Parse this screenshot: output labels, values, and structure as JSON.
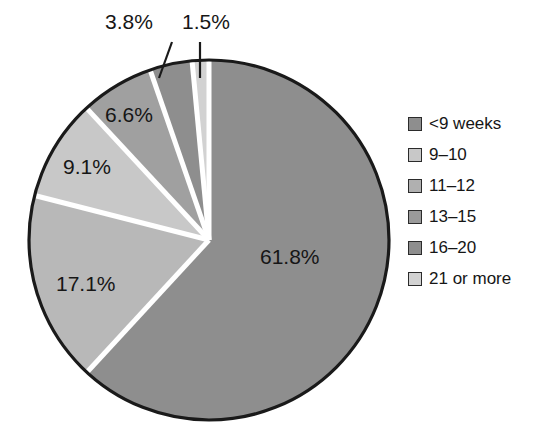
{
  "chart_data": {
    "type": "pie",
    "title": "",
    "subtitle": "",
    "xlabel": "",
    "ylabel": "",
    "grid": false,
    "legend_position": "right",
    "start_angle_deg": 0,
    "direction": "clockwise",
    "center": {
      "x": 209,
      "y": 240
    },
    "radius": 180,
    "categories": [
      "<9 weeks",
      "9–10",
      "11–12",
      "13–15",
      "16–20",
      "21 or more"
    ],
    "values": [
      61.8,
      17.1,
      9.1,
      6.6,
      3.8,
      1.5
    ],
    "value_labels": [
      "61.8%",
      "17.1%",
      "9.1%",
      "6.6%",
      "3.8%",
      "1.5%"
    ],
    "units": "percent",
    "colors": [
      "#8e8e8e",
      "#b8b8b8",
      "#c8c8c8",
      "#a0a0a0",
      "#8e8e8e",
      "#d2d2d2"
    ],
    "slice_separator_color": "#ffffff",
    "outline_color": "#1a1a1a",
    "leader_line_slices": [
      "3.8%",
      "1.5%"
    ]
  },
  "legend": {
    "items": [
      {
        "label": "<9 weeks",
        "color": "#8e8e8e"
      },
      {
        "label": "9–10",
        "color": "#c8c8c8"
      },
      {
        "label": "11–12",
        "color": "#b0b0b0"
      },
      {
        "label": "13–15",
        "color": "#9a9a9a"
      },
      {
        "label": "16–20",
        "color": "#8e8e8e"
      },
      {
        "label": "21 or more",
        "color": "#d2d2d2"
      }
    ]
  },
  "slice_labels": {
    "s1": "61.8%",
    "s2": "17.1%",
    "s3": "9.1%",
    "s4": "6.6%",
    "s5": "3.8%",
    "s6": "1.5%"
  }
}
